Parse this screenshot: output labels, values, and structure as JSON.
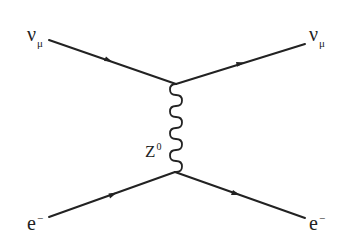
{
  "diagram": {
    "type": "feynman",
    "process": "neutral-current neutrino-electron scattering",
    "line_color": "#222222",
    "particles": {
      "in_top": {
        "symbol": "ν",
        "subscript": "μ"
      },
      "out_top": {
        "symbol": "ν",
        "subscript": "μ"
      },
      "in_bottom": {
        "symbol": "e",
        "superscript": "−"
      },
      "out_bottom": {
        "symbol": "e",
        "superscript": "−"
      },
      "propagator": {
        "symbol": "Z",
        "superscript": "0"
      }
    }
  }
}
